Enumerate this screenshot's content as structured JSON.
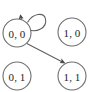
{
  "diagram": {
    "type": "state-transition-graph",
    "background_color": "#ffffff",
    "node_stroke_color": "#6e6e6e",
    "edge_stroke_color": "#5f5f5f",
    "label_color": "#1c1c1c",
    "nodes": [
      {
        "id": "n00",
        "label": "0, 0",
        "cx": 17,
        "cy": 33,
        "r": 14
      },
      {
        "id": "n10",
        "label": "1, 0",
        "cx": 72,
        "cy": 32,
        "r": 14
      },
      {
        "id": "n01",
        "label": "0, 1",
        "cx": 17,
        "cy": 76,
        "r": 14
      },
      {
        "id": "n11",
        "label": "1, 1",
        "cx": 72,
        "cy": 76,
        "r": 14
      }
    ],
    "edges": [
      {
        "id": "e-self-00",
        "from": "n00",
        "to": "n00",
        "kind": "self-loop"
      },
      {
        "id": "e-00-11",
        "from": "n00",
        "to": "n11",
        "kind": "straight"
      }
    ]
  }
}
